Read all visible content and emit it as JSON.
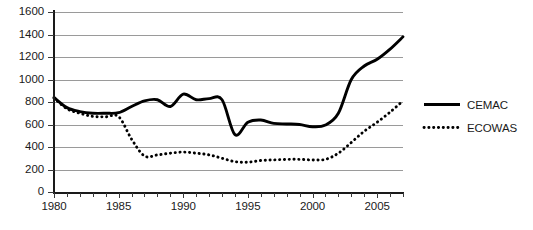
{
  "chart_data": {
    "type": "line",
    "title": "",
    "xlabel": "",
    "ylabel": "",
    "xlim": [
      1980,
      2007
    ],
    "ylim": [
      0,
      1600
    ],
    "grid": "horizontal",
    "legend_position": "right-outside",
    "y_ticks": [
      "1600",
      "1400",
      "1200",
      "1000",
      "800",
      "600",
      "400",
      "200",
      "0"
    ],
    "x_ticks": [
      "1980",
      "1985",
      "1990",
      "1995",
      "2000",
      "2005"
    ],
    "x_minor_tick_years": [
      1980,
      1981,
      1982,
      1983,
      1984,
      1985,
      1986,
      1987,
      1988,
      1989,
      1990,
      1991,
      1992,
      1993,
      1994,
      1995,
      1996,
      1997,
      1998,
      1999,
      2000,
      2001,
      2002,
      2003,
      2004,
      2005,
      2006,
      2007
    ],
    "x": [
      1980,
      1981,
      1982,
      1983,
      1984,
      1985,
      1986,
      1987,
      1988,
      1989,
      1990,
      1991,
      1992,
      1993,
      1994,
      1995,
      1996,
      1997,
      1998,
      1999,
      2000,
      2001,
      2002,
      2003,
      2004,
      2005,
      2006,
      2007
    ],
    "series": [
      {
        "name": "CEMAC",
        "style": "solid",
        "color": "#000000",
        "values": [
          840,
          750,
          715,
          700,
          700,
          705,
          760,
          810,
          820,
          760,
          870,
          820,
          830,
          820,
          510,
          620,
          640,
          610,
          605,
          600,
          580,
          595,
          700,
          1000,
          1120,
          1180,
          1270,
          1380
        ]
      },
      {
        "name": "ECOWAS",
        "style": "dotted",
        "color": "#000000",
        "values": [
          835,
          740,
          700,
          672,
          668,
          670,
          470,
          320,
          330,
          345,
          355,
          345,
          330,
          300,
          270,
          265,
          280,
          285,
          290,
          290,
          285,
          290,
          345,
          440,
          540,
          620,
          710,
          810
        ]
      }
    ]
  },
  "legend": {
    "items": [
      {
        "label": "CEMAC",
        "style": "solid"
      },
      {
        "label": "ECOWAS",
        "style": "dotted"
      }
    ]
  }
}
